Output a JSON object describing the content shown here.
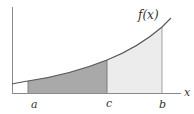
{
  "diagram": {
    "function_label": "f(x)",
    "x_axis_label": "x",
    "points": [
      {
        "id": "a",
        "label": "a"
      },
      {
        "id": "c",
        "label": "c"
      },
      {
        "id": "b",
        "label": "b"
      }
    ],
    "regions": [
      {
        "id": "a-to-c",
        "from": "a",
        "to": "c",
        "fill": "#a9a9a9"
      },
      {
        "id": "c-to-b",
        "from": "c",
        "to": "b",
        "fill": "#ececec"
      }
    ],
    "colors": {
      "axis": "#8a8a8a",
      "curve": "#555555",
      "dark_region": "#a9a9a9",
      "light_region": "#ececec",
      "divider": "#777777"
    }
  }
}
